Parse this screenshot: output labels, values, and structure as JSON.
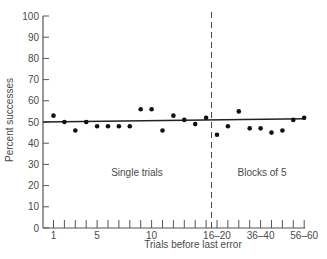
{
  "chart_data": {
    "type": "scatter",
    "title": "",
    "xlabel": "Trials before last error",
    "ylabel": "Percent successes",
    "ylim": [
      0,
      100
    ],
    "y_ticks": [
      0,
      10,
      20,
      30,
      40,
      50,
      60,
      70,
      80,
      90,
      100
    ],
    "x_tick_labels": [
      {
        "label": "1",
        "index": 0
      },
      {
        "label": "5",
        "index": 4
      },
      {
        "label": "10",
        "index": 9
      },
      {
        "label": "16–20",
        "index": 15
      },
      {
        "label": "36–40",
        "index": 19
      },
      {
        "label": "56–60",
        "index": 23
      }
    ],
    "x_tick_count": 24,
    "grid": false,
    "divider_index": 14.5,
    "annotations": [
      {
        "text": "Single trials",
        "region": "left"
      },
      {
        "text": "Blocks of 5",
        "region": "right"
      }
    ],
    "series": [
      {
        "name": "Percent successes",
        "x": [
          "1",
          "2",
          "3",
          "4",
          "5",
          "6",
          "7",
          "8",
          "9",
          "10",
          "11",
          "12",
          "13",
          "14",
          "15",
          "16–20",
          "21–25",
          "26–30",
          "31–35",
          "36–40",
          "41–45",
          "46–50",
          "51–55",
          "56–60"
        ],
        "values": [
          53,
          50,
          46,
          50,
          48,
          48,
          48,
          48,
          56,
          56,
          46,
          53,
          51,
          49,
          52,
          44,
          48,
          55,
          47,
          47,
          45,
          46,
          51,
          52
        ]
      }
    ],
    "trend_line": {
      "start": 50,
      "end": 51.5
    }
  }
}
